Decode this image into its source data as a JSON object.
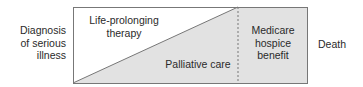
{
  "diagram": {
    "start_label": "Diagnosis\nof serious\nillness",
    "start_label_lines": [
      "Diagnosis",
      "of serious",
      "illness"
    ],
    "end_label": "Death",
    "regions": {
      "life_prolonging": {
        "lines": [
          "Life-prolonging",
          "therapy"
        ]
      },
      "palliative": {
        "label": "Palliative care"
      },
      "hospice": {
        "lines": [
          "Medicare",
          "hospice",
          "benefit"
        ]
      }
    },
    "colors": {
      "fill": "#e2e2e2",
      "border": "#777777",
      "background": "#ffffff",
      "text": "#2a2a2a"
    }
  }
}
